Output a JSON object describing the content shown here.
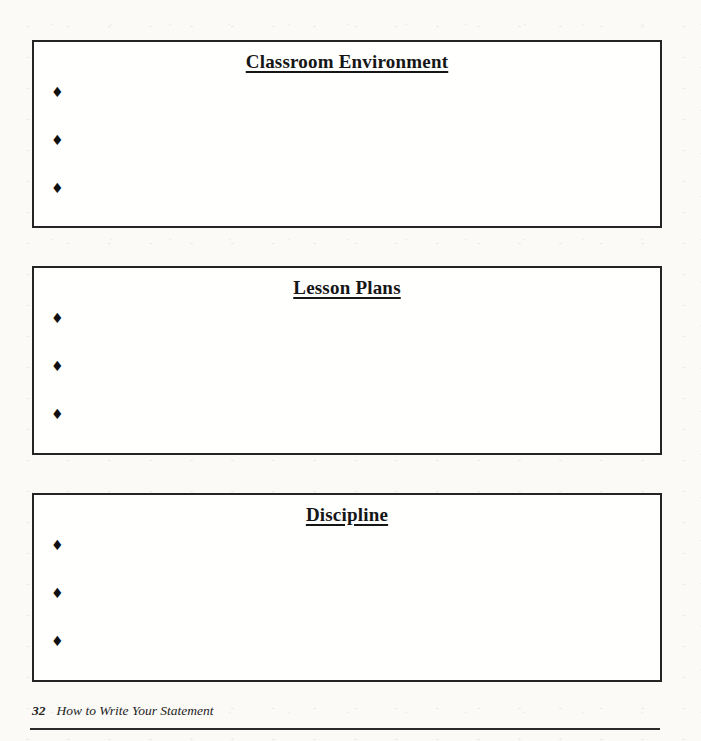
{
  "document": {
    "sections": [
      {
        "title": "Classroom Environment",
        "bullets": [
          {
            "marker": "♦",
            "text": ""
          },
          {
            "marker": "♦",
            "text": ""
          },
          {
            "marker": "♦",
            "text": ""
          }
        ]
      },
      {
        "title": "Lesson Plans",
        "bullets": [
          {
            "marker": "♦",
            "text": ""
          },
          {
            "marker": "♦",
            "text": ""
          },
          {
            "marker": "♦",
            "text": ""
          }
        ]
      },
      {
        "title": "Discipline",
        "bullets": [
          {
            "marker": "♦",
            "text": ""
          },
          {
            "marker": "♦",
            "text": ""
          },
          {
            "marker": "♦",
            "text": ""
          }
        ]
      }
    ],
    "footer": {
      "page_number": "32",
      "book_title": "How to Write Your Statement"
    },
    "colors": {
      "ink": "#1b1b1b",
      "paper": "#fbfaf7",
      "box_background": "#fffffe",
      "border": "#242424"
    }
  }
}
